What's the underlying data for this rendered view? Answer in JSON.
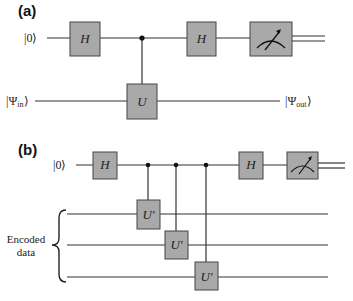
{
  "panel_a": {
    "label": "(a)",
    "input_top": "|0⟩",
    "input_bottom": "|Ψin⟩",
    "output_bottom": "|Ψout⟩",
    "gates": {
      "h1": "H",
      "h2": "H",
      "u": "U"
    },
    "measurement": "meter-icon"
  },
  "panel_b": {
    "label": "(b)",
    "input_top": "|0⟩",
    "gates": {
      "h1": "H",
      "h2": "H",
      "u1": "U′",
      "u2": "U′",
      "u3": "U′"
    },
    "side_label_line1": "Encoded",
    "side_label_line2": "data",
    "measurement": "meter-icon"
  }
}
